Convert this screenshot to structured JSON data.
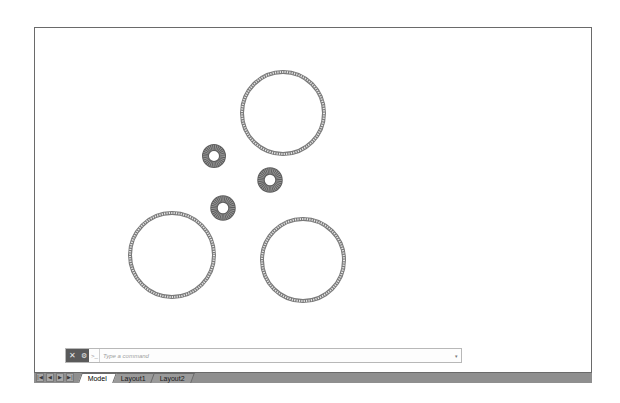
{
  "viewport": {
    "background": "#ffffff",
    "border_color": "#6a6a6a"
  },
  "drawing": {
    "large_circles": [
      {
        "cx": 283,
        "cy": 113,
        "r": 41
      },
      {
        "cx": 172,
        "cy": 255,
        "r": 42
      },
      {
        "cx": 303,
        "cy": 260,
        "r": 41
      }
    ],
    "small_rings": [
      {
        "cx": 214,
        "cy": 156,
        "r_outer": 12,
        "r_inner": 5
      },
      {
        "cx": 270,
        "cy": 180,
        "r_outer": 13,
        "r_inner": 5
      },
      {
        "cx": 223,
        "cy": 208,
        "r_outer": 13,
        "r_inner": 5
      }
    ],
    "stroke_color": "#7a7a7a",
    "ring_fill": "#6e6e6e"
  },
  "command_line": {
    "close_icon": "✕",
    "settings_icon": "🔧",
    "prompt_icon": ">_",
    "placeholder": "Type a command",
    "value": "",
    "dropdown_icon": "▾"
  },
  "tabbar": {
    "nav_buttons": [
      "|◀",
      "◀",
      "▶",
      "▶|"
    ],
    "tabs": [
      {
        "label": "Model",
        "active": true
      },
      {
        "label": "Layout1",
        "active": false
      },
      {
        "label": "Layout2",
        "active": false
      }
    ]
  }
}
